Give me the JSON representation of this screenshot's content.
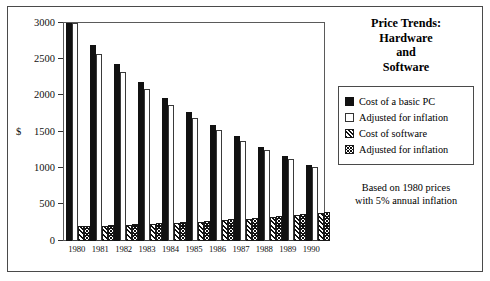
{
  "chart_data": {
    "type": "bar",
    "title_lines": [
      "Price Trends:",
      "Hardware",
      "and",
      "Software"
    ],
    "xlabel": "",
    "ylabel": "$",
    "ylim": [
      0,
      3000
    ],
    "yticks": [
      0,
      500,
      1000,
      1500,
      2000,
      2500,
      3000
    ],
    "ytick_labels": [
      "0",
      "500",
      "1000",
      "1500",
      "2000",
      "2500",
      "3000"
    ],
    "grid": false,
    "legend_position": "right",
    "categories": [
      "1980",
      "1981",
      "1982",
      "1983",
      "1984",
      "1985",
      "1986",
      "1987",
      "1988",
      "1989",
      "1990"
    ],
    "series": [
      {
        "name": "Cost of a basic PC",
        "style": "solid-black",
        "values": [
          3000,
          2700,
          2430,
          2190,
          1970,
          1770,
          1600,
          1440,
          1300,
          1170,
          1050
        ]
      },
      {
        "name": "Adjusted for inflation",
        "style": "white-outline",
        "values": [
          3000,
          2570,
          2320,
          2090,
          1870,
          1690,
          1530,
          1380,
          1250,
          1130,
          1020
        ]
      },
      {
        "name": "Cost of software",
        "style": "diagonal-hatch",
        "values": [
          200,
          210,
          225,
          235,
          250,
          265,
          285,
          300,
          325,
          355,
          390
        ]
      },
      {
        "name": "Adjusted for inflation",
        "style": "dense-cross-hatch",
        "values": [
          200,
          215,
          230,
          245,
          260,
          280,
          300,
          320,
          345,
          375,
          405
        ]
      }
    ],
    "annotation": "Based on 1980 prices with 5% annual inflation",
    "annotation_lines": [
      "Based on 1980 prices",
      "with 5% annual inflation"
    ]
  },
  "legend": {
    "items": [
      {
        "label": "Cost of a basic PC"
      },
      {
        "label": "Adjusted for inflation"
      },
      {
        "label": "Cost of software"
      },
      {
        "label": "Adjusted for inflation"
      }
    ]
  },
  "colors": {
    "series_solid": "#111111",
    "series_outline": "#ffffff",
    "frame": "#4a4a4a",
    "text": "#000000",
    "background": "#ffffff"
  }
}
